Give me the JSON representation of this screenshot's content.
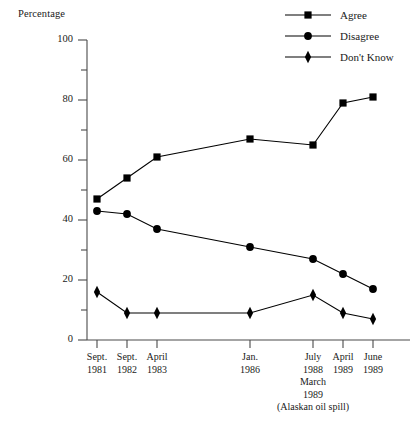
{
  "chart_data": {
    "type": "line",
    "title": "",
    "ylabel": "Percentage",
    "xlabel": "",
    "ylim": [
      0,
      100
    ],
    "yticks": [
      0,
      20,
      40,
      60,
      80,
      100
    ],
    "yticks_minor": [
      10,
      30,
      50,
      70,
      90
    ],
    "grid": false,
    "legend_position": "top-right",
    "categories": [
      "Sept. 1981",
      "Sept. 1982",
      "April 1983",
      "Jan. 1986",
      "July 1988",
      "April 1989",
      "June 1989"
    ],
    "category_lines": [
      [
        "Sept.",
        "1981"
      ],
      [
        "Sept.",
        "1982"
      ],
      [
        "April",
        "1983"
      ],
      [
        "Jan.",
        "1986"
      ],
      [
        "July",
        "1988"
      ],
      [
        "April",
        "1989"
      ],
      [
        "June",
        "1989"
      ]
    ],
    "x_positions": [
      97,
      127,
      157,
      250,
      313,
      343,
      373
    ],
    "series": [
      {
        "name": "Agree",
        "marker": "square",
        "color": "#000000",
        "values": [
          47,
          54,
          61,
          67,
          65,
          79,
          81
        ]
      },
      {
        "name": "Disagree",
        "marker": "circle",
        "color": "#000000",
        "values": [
          43,
          42,
          37,
          31,
          27,
          22,
          17
        ]
      },
      {
        "name": "Don't Know",
        "marker": "diamond",
        "color": "#000000",
        "values": [
          16,
          9,
          9,
          9,
          15,
          9,
          7
        ]
      }
    ],
    "annotations": [
      {
        "name": "alaskan-oil-spill",
        "lines": [
          "March",
          "1989",
          "(Alaskan oil spill)"
        ],
        "x_category": "July 1988"
      }
    ]
  },
  "legend": {
    "items": [
      {
        "label": "Agree",
        "marker": "square"
      },
      {
        "label": "Disagree",
        "marker": "circle"
      },
      {
        "label": "Don't Know",
        "marker": "diamond"
      }
    ]
  },
  "axes": {
    "y_title": "Percentage",
    "y_tick_labels": [
      "100",
      "80",
      "60",
      "40",
      "20",
      "0"
    ]
  }
}
